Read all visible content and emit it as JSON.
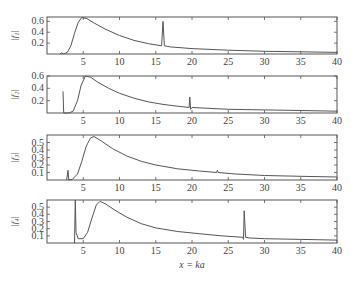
{
  "chart_data": {
    "type": "line",
    "xlabel": "x = ka",
    "xlim": [
      0,
      40
    ],
    "xticks": [
      5,
      10,
      15,
      20,
      25,
      30,
      35,
      40
    ],
    "grid": false,
    "legend": null,
    "panels": [
      {
        "ylabel": "|f₁|",
        "ylim": [
          0,
          0.68
        ],
        "yticks": [
          0.2,
          0.4,
          0.6
        ],
        "box": {
          "top": 17,
          "bottom": 54
        },
        "points": [
          [
            1.8,
            0.0
          ],
          [
            2.0,
            0.02
          ],
          [
            2.3,
            0.0
          ],
          [
            2.8,
            0.03
          ],
          [
            3.3,
            0.15
          ],
          [
            3.8,
            0.38
          ],
          [
            4.3,
            0.58
          ],
          [
            4.8,
            0.67
          ],
          [
            5.5,
            0.65
          ],
          [
            6.5,
            0.57
          ],
          [
            8,
            0.46
          ],
          [
            10,
            0.34
          ],
          [
            12,
            0.25
          ],
          [
            14,
            0.19
          ],
          [
            15.8,
            0.15
          ],
          [
            16.0,
            0.6
          ],
          [
            16.2,
            0.15
          ],
          [
            17,
            0.13
          ],
          [
            20,
            0.1
          ],
          [
            25,
            0.07
          ],
          [
            30,
            0.05
          ],
          [
            35,
            0.04
          ],
          [
            40,
            0.03
          ]
        ]
      },
      {
        "ylabel": "|f₂|",
        "ylim": [
          0,
          0.6
        ],
        "yticks": [
          0.2,
          0.4,
          0.6
        ],
        "box": {
          "top": 76,
          "bottom": 113
        },
        "points": [
          [
            2.2,
            0.35
          ],
          [
            2.3,
            0.0
          ],
          [
            3.0,
            0.0
          ],
          [
            3.6,
            0.03
          ],
          [
            4.2,
            0.2
          ],
          [
            4.7,
            0.45
          ],
          [
            5.3,
            0.6
          ],
          [
            6,
            0.58
          ],
          [
            7,
            0.5
          ],
          [
            8.5,
            0.4
          ],
          [
            10,
            0.32
          ],
          [
            12,
            0.24
          ],
          [
            14,
            0.18
          ],
          [
            16,
            0.14
          ],
          [
            18,
            0.11
          ],
          [
            19.6,
            0.09
          ],
          [
            19.7,
            0.26
          ],
          [
            19.8,
            0.06
          ],
          [
            20,
            0.09
          ],
          [
            25,
            0.06
          ],
          [
            30,
            0.05
          ],
          [
            35,
            0.04
          ],
          [
            40,
            0.03
          ]
        ]
      },
      {
        "ylabel": "|f₃|",
        "ylim": [
          0,
          0.6
        ],
        "yticks": [
          0.1,
          0.2,
          0.3,
          0.4,
          0.5
        ],
        "box": {
          "top": 135,
          "bottom": 180
        },
        "points": [
          [
            2.7,
            0.0
          ],
          [
            2.9,
            0.13
          ],
          [
            3.0,
            0.0
          ],
          [
            3.5,
            0.01
          ],
          [
            4.2,
            0.08
          ],
          [
            4.8,
            0.25
          ],
          [
            5.4,
            0.45
          ],
          [
            6.0,
            0.56
          ],
          [
            6.5,
            0.58
          ],
          [
            7.5,
            0.52
          ],
          [
            9,
            0.42
          ],
          [
            11,
            0.32
          ],
          [
            13,
            0.25
          ],
          [
            15,
            0.2
          ],
          [
            18,
            0.15
          ],
          [
            21,
            0.12
          ],
          [
            23.4,
            0.1
          ],
          [
            23.5,
            0.13
          ],
          [
            23.6,
            0.1
          ],
          [
            26,
            0.08
          ],
          [
            30,
            0.06
          ],
          [
            35,
            0.05
          ],
          [
            40,
            0.04
          ]
        ]
      },
      {
        "ylabel": "|f₄|",
        "ylim": [
          0,
          0.6
        ],
        "yticks": [
          0.1,
          0.2,
          0.3,
          0.4,
          0.5
        ],
        "box": {
          "top": 200,
          "bottom": 243
        },
        "points": [
          [
            3.8,
            0.0
          ],
          [
            3.9,
            0.6
          ],
          [
            4.0,
            0.15
          ],
          [
            4.3,
            0.06
          ],
          [
            5,
            0.06
          ],
          [
            5.6,
            0.15
          ],
          [
            6.2,
            0.35
          ],
          [
            6.8,
            0.53
          ],
          [
            7.3,
            0.58
          ],
          [
            8,
            0.55
          ],
          [
            9.5,
            0.45
          ],
          [
            11,
            0.36
          ],
          [
            13,
            0.27
          ],
          [
            15,
            0.21
          ],
          [
            18,
            0.16
          ],
          [
            21,
            0.13
          ],
          [
            24,
            0.1
          ],
          [
            27.0,
            0.08
          ],
          [
            27.1,
            0.05
          ],
          [
            27.2,
            0.45
          ],
          [
            27.4,
            0.08
          ],
          [
            28,
            0.07
          ],
          [
            30,
            0.06
          ],
          [
            35,
            0.05
          ],
          [
            40,
            0.04
          ]
        ]
      }
    ]
  },
  "frame": {
    "left": 47,
    "right": 337,
    "line_color": "#555555",
    "curve_color": "#555555"
  }
}
